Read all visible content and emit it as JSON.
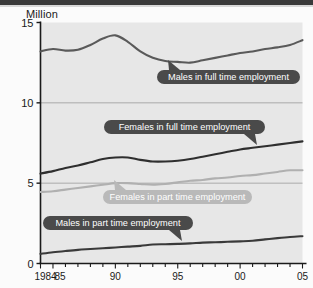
{
  "chart_data": {
    "type": "line",
    "title": "",
    "ylabel": "Million",
    "xlabel": "",
    "ylim": [
      0,
      15
    ],
    "yticks": [
      0,
      5,
      10,
      15
    ],
    "xlim": [
      1984,
      2005
    ],
    "xticks": [
      1984,
      1985,
      1990,
      1995,
      2000,
      2005
    ],
    "xticklabels": [
      "1984",
      "85",
      "90",
      "95",
      "00",
      "05"
    ],
    "grid": "horizontal",
    "legend": "inline-callouts",
    "x": [
      1984,
      1985,
      1986,
      1987,
      1988,
      1989,
      1990,
      1991,
      1992,
      1993,
      1994,
      1995,
      1996,
      1997,
      1998,
      1999,
      2000,
      2001,
      2002,
      2003,
      2004,
      2005
    ],
    "series": [
      {
        "name": "Males in full time employment",
        "color": "#5a5a5a",
        "values": [
          13.2,
          13.35,
          13.25,
          13.3,
          13.6,
          14.0,
          14.2,
          13.8,
          13.2,
          12.8,
          12.6,
          12.55,
          12.5,
          12.65,
          12.8,
          12.95,
          13.1,
          13.2,
          13.35,
          13.45,
          13.6,
          13.9
        ]
      },
      {
        "name": "Females in full time employment",
        "color": "#2f2f2f",
        "values": [
          5.6,
          5.75,
          5.95,
          6.1,
          6.3,
          6.5,
          6.6,
          6.6,
          6.45,
          6.35,
          6.35,
          6.4,
          6.5,
          6.65,
          6.8,
          6.95,
          7.1,
          7.2,
          7.3,
          7.4,
          7.5,
          7.6
        ]
      },
      {
        "name": "Females in part time employment",
        "color": "#b0b0b0",
        "values": [
          4.45,
          4.5,
          4.6,
          4.7,
          4.8,
          4.9,
          5.0,
          5.0,
          4.95,
          4.9,
          4.95,
          5.05,
          5.15,
          5.2,
          5.3,
          5.35,
          5.45,
          5.5,
          5.6,
          5.7,
          5.8,
          5.8
        ]
      },
      {
        "name": "Males in part time employment",
        "color": "#3a3a3a",
        "values": [
          0.6,
          0.7,
          0.78,
          0.85,
          0.9,
          0.95,
          1.0,
          1.05,
          1.1,
          1.18,
          1.2,
          1.22,
          1.25,
          1.3,
          1.32,
          1.35,
          1.38,
          1.42,
          1.5,
          1.58,
          1.65,
          1.7
        ]
      }
    ],
    "annotations": [
      {
        "label": "Males in full time employment",
        "style": "dark",
        "pointer": "top-left"
      },
      {
        "label": "Females in full time employment",
        "style": "dark",
        "pointer": "bottom-right"
      },
      {
        "label": "Females in part time employment",
        "style": "light",
        "pointer": "top-left"
      },
      {
        "label": "Males in part time employment",
        "style": "dark",
        "pointer": "bottom-right"
      }
    ]
  },
  "colors": {
    "plot_background": "#e7e7e7",
    "page_background": "#fbfbfb",
    "axis": "#1a1a1a",
    "grid": "#9a9a9a",
    "pill_dark": "#4a4a4a",
    "pill_light": "#b9b9b9"
  }
}
